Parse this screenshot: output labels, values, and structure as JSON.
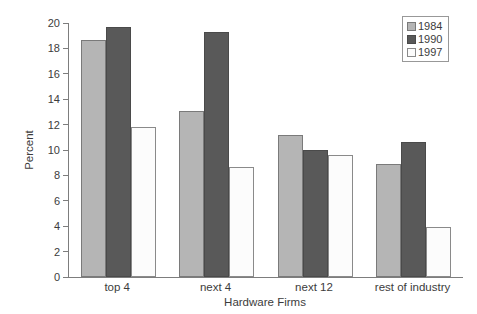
{
  "chart_data": {
    "type": "bar",
    "title": "",
    "xlabel": "Hardware Firms",
    "ylabel": "Percent",
    "categories": [
      "top 4",
      "next 4",
      "next 12",
      "rest of industry"
    ],
    "series": [
      {
        "name": "1984",
        "values": [
          18.7,
          13.1,
          11.2,
          8.9
        ],
        "color": "#b5b5b5",
        "border": "#7a7a7a"
      },
      {
        "name": "1990",
        "values": [
          19.7,
          19.3,
          10.0,
          10.6
        ],
        "color": "#595959",
        "border": "#4a4a4a"
      },
      {
        "name": "1997",
        "values": [
          11.8,
          8.7,
          9.6,
          3.9
        ],
        "color": "#fcfcfc",
        "border": "#8a8a8a"
      }
    ],
    "ylim": [
      0,
      20
    ],
    "yticks": [
      0,
      2,
      4,
      6,
      8,
      10,
      12,
      14,
      16,
      18,
      20
    ],
    "legend_position": "top-right",
    "grid": false,
    "axis_color": "#7d7d7d",
    "text_color": "#3c3c3c"
  }
}
